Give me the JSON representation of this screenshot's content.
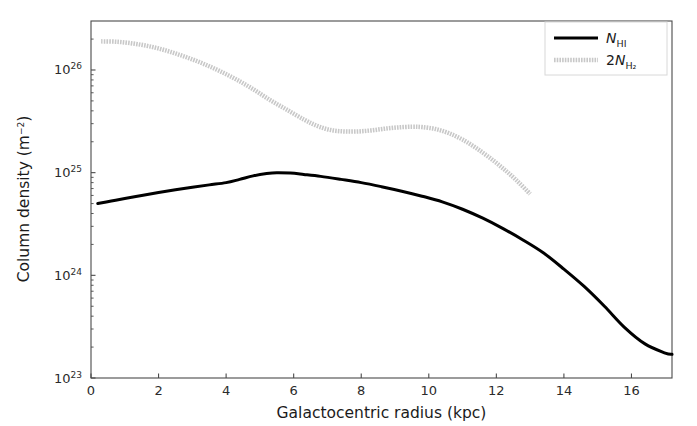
{
  "chart_data": {
    "type": "line",
    "title": "",
    "xlabel": "Galactocentric radius (kpc)",
    "ylabel": "Column density (m−2)",
    "ylabel_base": "Column density (m",
    "ylabel_exp": "−2",
    "ylabel_close": ")",
    "yscale": "log",
    "xscale": "linear",
    "xlim": [
      0,
      17.2
    ],
    "ylim": [
      1e+23,
      3e+26
    ],
    "grid": false,
    "legend_position": "upper right",
    "xticks": [
      0,
      2,
      4,
      6,
      8,
      10,
      12,
      14,
      16
    ],
    "xtick_labels": [
      "0",
      "2",
      "4",
      "6",
      "8",
      "10",
      "12",
      "14",
      "16"
    ],
    "yticks": [
      1e+23,
      1e+24,
      1e+25,
      1e+26
    ],
    "ytick_labels": [
      "10^23",
      "10^24",
      "10^25",
      "10^26"
    ],
    "ytick_mantissa": "10",
    "ytick_exponents": [
      "23",
      "24",
      "25",
      "26"
    ],
    "series": [
      {
        "name": "N_HI",
        "legend_label": "N",
        "legend_sub": "HI",
        "legend_prefix": "",
        "color": "#000000",
        "linestyle": "solid",
        "linewidth": 3.0,
        "x": [
          0.2,
          0.6,
          1.0,
          1.5,
          2.0,
          2.5,
          3.0,
          3.5,
          4.0,
          4.4,
          4.8,
          5.2,
          5.5,
          5.9,
          6.3,
          6.8,
          7.4,
          8.0,
          8.6,
          9.2,
          9.8,
          10.4,
          11.0,
          11.6,
          12.2,
          12.8,
          13.4,
          14.0,
          14.6,
          15.2,
          15.8,
          16.4,
          17.0,
          17.2
        ],
        "y": [
          5e+24,
          5.3e+24,
          5.6e+24,
          6e+24,
          6.4e+24,
          6.8e+24,
          7.2e+24,
          7.6e+24,
          8e+24,
          8.6e+24,
          9.3e+24,
          9.8e+24,
          1e+25,
          9.9e+24,
          9.6e+24,
          9.2e+24,
          8.6e+24,
          8e+24,
          7.3e+24,
          6.6e+24,
          5.9e+24,
          5.2e+24,
          4.4e+24,
          3.6e+24,
          2.85e+24,
          2.2e+24,
          1.65e+24,
          1.15e+24,
          7.8e+23,
          5e+23,
          3.1e+23,
          2.15e+23,
          1.75e+23,
          1.7e+23
        ]
      },
      {
        "name": "2N_H2",
        "legend_label": "N",
        "legend_sub": "H₂",
        "legend_prefix": "2",
        "color": "#c8c8c8",
        "linestyle": "dotted-thick",
        "linewidth": 4.5,
        "x": [
          0.3,
          0.8,
          1.3,
          1.8,
          2.3,
          2.8,
          3.3,
          3.8,
          4.3,
          4.8,
          5.3,
          5.8,
          6.3,
          6.7,
          7.1,
          7.5,
          7.9,
          8.3,
          8.7,
          9.1,
          9.5,
          9.8,
          10.2,
          10.6,
          11.0,
          11.4,
          11.8,
          12.2,
          12.6,
          13.0
        ],
        "y": [
          1.9e+26,
          1.88e+26,
          1.8e+26,
          1.68e+26,
          1.52e+26,
          1.34e+26,
          1.16e+26,
          9.8e+25,
          8.1e+25,
          6.5e+25,
          5.1e+25,
          4.1e+25,
          3.3e+25,
          2.85e+25,
          2.6e+25,
          2.52e+25,
          2.52e+25,
          2.58e+25,
          2.68e+25,
          2.76e+25,
          2.8e+25,
          2.78e+25,
          2.66e+25,
          2.42e+25,
          2.1e+25,
          1.74e+25,
          1.4e+25,
          1.1e+25,
          8.4e+24,
          6.2e+24
        ]
      }
    ]
  },
  "axes": {
    "plot_left_px": 91,
    "plot_right_px": 672,
    "plot_top_px": 21,
    "plot_bottom_px": 378,
    "spine_color": "#4a4a4a"
  },
  "legend": {
    "box_color": "#ffffff",
    "border_color": "#d8d8d8",
    "entries": [
      {
        "prefix": "",
        "symbol": "N",
        "sub": "HI"
      },
      {
        "prefix": "2",
        "symbol": "N",
        "sub": "H₂"
      }
    ]
  }
}
